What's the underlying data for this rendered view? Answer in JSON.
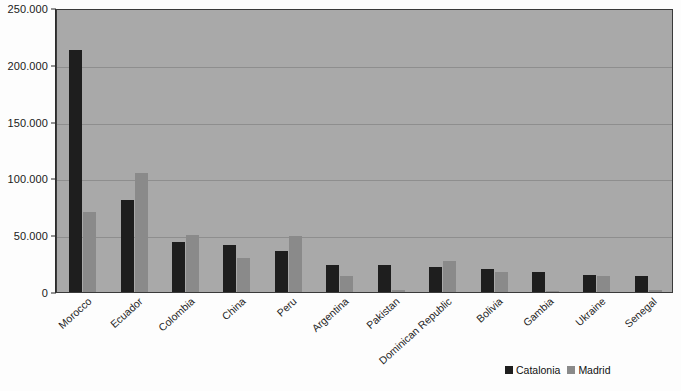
{
  "chart_data": {
    "type": "bar",
    "title": "",
    "subtitle": "",
    "xlabel": "",
    "ylabel": "",
    "ylim": [
      0,
      250000
    ],
    "ytick_labels": [
      "0",
      "50.000",
      "100.000",
      "150.000",
      "200.000",
      "250.000"
    ],
    "ytick_values": [
      0,
      50000,
      100000,
      150000,
      200000,
      250000
    ],
    "grid": true,
    "legend_position": "bottom-right",
    "categories": [
      "Morocco",
      "Ecuador",
      "Colombia",
      "China",
      "Peru",
      "Argentina",
      "Pakistan",
      "Dominican Republic",
      "Bolivia",
      "Gambia",
      "Ukraine",
      "Senegal"
    ],
    "series": [
      {
        "name": "Catalonia",
        "color": "#1e1e1e",
        "values": [
          213000,
          81000,
          44000,
          41000,
          36000,
          24000,
          23500,
          22000,
          20000,
          18000,
          15000,
          14000
        ]
      },
      {
        "name": "Madrid",
        "color": "#8a8a8a",
        "values": [
          70000,
          105000,
          50000,
          30000,
          49000,
          14000,
          2000,
          27000,
          18000,
          1000,
          14000,
          1500
        ]
      }
    ]
  },
  "legend": {
    "items": [
      {
        "label": "Catalonia",
        "color": "#1e1e1e"
      },
      {
        "label": "Madrid",
        "color": "#8a8a8a"
      }
    ]
  }
}
